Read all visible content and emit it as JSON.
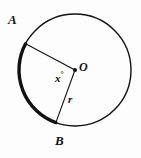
{
  "figure": {
    "type": "geometry-diagram",
    "background_color": "#fdfdfd",
    "stroke_color": "#111111",
    "labels": {
      "point_a": "A",
      "point_b": "B",
      "center": "O",
      "angle": "x",
      "angle_degree_symbol": "°",
      "radius": "r"
    },
    "geometry": {
      "center_x": 75,
      "center_y": 70,
      "radius": 56,
      "point_a_angle_deg": 152,
      "point_b_angle_deg": 250,
      "circle_stroke_width": 1.4,
      "arc_stroke_width": 3.4,
      "radius_stroke_width": 1.1,
      "center_dot_radius": 2.0
    }
  }
}
